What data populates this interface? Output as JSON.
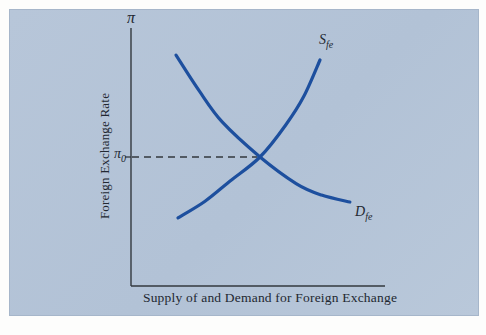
{
  "labels": {
    "pi_top": "π",
    "pi0": {
      "main": "π",
      "sub": "0"
    },
    "supply": {
      "main": "S",
      "sub": "fe"
    },
    "demand": {
      "main": "D",
      "sub": "fe"
    },
    "y_axis": "Foreign Exchange Rate",
    "x_axis": "Supply of and Demand for Foreign Exchange"
  },
  "colors": {
    "panel_bg": "#b7c6d9",
    "curve": "#1d4f9e",
    "axis": "#33383e",
    "text": "#222831"
  },
  "chart_data": {
    "type": "line",
    "title": "",
    "xlabel": "Supply of and Demand for Foreign Exchange",
    "ylabel": "Foreign Exchange Rate",
    "y_axis_top_symbol": "π",
    "axes": {
      "x_range_pct": [
        0,
        100
      ],
      "y_range_pct": [
        0,
        100
      ],
      "grid": false,
      "ticks": "none except equilibrium tick on y-axis"
    },
    "series": [
      {
        "name": "Sfe",
        "role": "supply",
        "shape": "increasing, convex (steepening)",
        "points_pct": [
          [
            18.5,
            26.6
          ],
          [
            29,
            33
          ],
          [
            39,
            41
          ],
          [
            50.8,
            50.4
          ],
          [
            61,
            63
          ],
          [
            68,
            74
          ],
          [
            74.4,
            88.3
          ]
        ]
      },
      {
        "name": "Dfe",
        "role": "demand",
        "shape": "decreasing, convex (flattening)",
        "points_pct": [
          [
            17.7,
            90.2
          ],
          [
            27,
            76
          ],
          [
            36,
            64
          ],
          [
            50.8,
            50.4
          ],
          [
            65,
            40
          ],
          [
            75,
            35.5
          ],
          [
            86.2,
            32.8
          ]
        ]
      }
    ],
    "equilibrium": {
      "price_label": "π0",
      "point_pct": [
        50.8,
        50.4
      ],
      "dashed_guide_to_y_axis": true
    },
    "legend": "curve labels placed at curve ends (Sfe top-right, Dfe bottom-right)"
  }
}
